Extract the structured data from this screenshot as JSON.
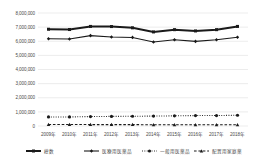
{
  "chart_data": {
    "type": "line",
    "title": "",
    "xlabel": "",
    "ylabel": "",
    "ylim": [
      0,
      8000000
    ],
    "ytick_step": 1000000,
    "grid": true,
    "legend_position": "bottom",
    "categories": [
      "2009年",
      "2010年",
      "2011年",
      "2012年",
      "2013年",
      "2014年",
      "2015年",
      "2016年",
      "2017年",
      "2018年"
    ],
    "ytick_labels": [
      "8,000,000",
      "7,000,000",
      "6,000,000",
      "5,000,000",
      "4,000,000",
      "3,000,000",
      "2,000,000",
      "1,000,000",
      "0"
    ],
    "ytick_values": [
      8000000,
      7000000,
      6000000,
      5000000,
      4000000,
      3000000,
      2000000,
      1000000,
      0
    ],
    "series": [
      {
        "name": "総数",
        "style": "solid-thick",
        "marker": "square",
        "values": [
          6850000,
          6830000,
          7050000,
          7040000,
          6950000,
          6660000,
          6820000,
          6730000,
          6820000,
          7050000
        ]
      },
      {
        "name": "医療用医薬品",
        "style": "solid",
        "marker": "diamond",
        "values": [
          6180000,
          6160000,
          6400000,
          6300000,
          6270000,
          5950000,
          6110000,
          5990000,
          6110000,
          6280000
        ]
      },
      {
        "name": "一般用医薬品",
        "style": "dotted",
        "marker": "circle",
        "values": [
          640000,
          640000,
          670000,
          680000,
          690000,
          700000,
          720000,
          740000,
          740000,
          760000
        ]
      },
      {
        "name": "配置用家庭薬",
        "style": "dashed",
        "marker": "triangle",
        "values": [
          110000,
          105000,
          100000,
          98000,
          95000,
          92000,
          90000,
          88000,
          86000,
          85000
        ]
      }
    ]
  },
  "legend": {
    "items": [
      {
        "label": "総数",
        "style": "solid-thick",
        "marker": "square"
      },
      {
        "label": "医療用医薬品",
        "style": "solid",
        "marker": "diamond"
      },
      {
        "label": "一般用医薬品",
        "style": "dotted",
        "marker": "circle"
      },
      {
        "label": "配置用家庭薬",
        "style": "dashed",
        "marker": "triangle"
      }
    ]
  },
  "colors": {
    "series": "#1a1a1a",
    "grid": "#d9d9d9",
    "text": "#4a4a4a",
    "background": "#ffffff"
  }
}
